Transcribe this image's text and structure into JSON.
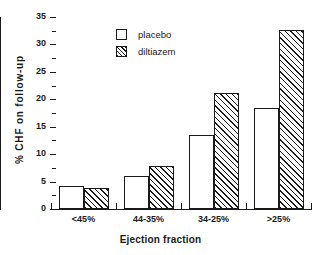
{
  "chart_data": {
    "type": "bar",
    "title": "",
    "xlabel": "Ejection fraction",
    "ylabel": "% CHF  on  follow-up",
    "categories": [
      "<45%",
      "44-35%",
      "34-25%",
      ">25%"
    ],
    "series": [
      {
        "name": "placebo",
        "values": [
          4.2,
          6.0,
          13.4,
          18.5
        ]
      },
      {
        "name": "diltiazem",
        "values": [
          3.9,
          7.9,
          21.2,
          32.7
        ]
      }
    ],
    "ylim": [
      0,
      35
    ],
    "yticks": [
      0,
      5,
      10,
      15,
      20,
      25,
      30,
      35
    ],
    "ytick_labels": [
      "0",
      "5",
      "10",
      "15",
      "20",
      "25",
      "30",
      "35"
    ],
    "grid": false,
    "legend_position": "upper-left-inside",
    "colors": {
      "axis": "#1a1a1a",
      "text": "#1a1a1a",
      "placebo_fill": "#ffffff",
      "diltiazem_fill": "#ffffff",
      "hatch": "#1a1a1a",
      "background": "#ffffff"
    }
  },
  "legend": {
    "items": [
      {
        "label": "placebo",
        "style": "open-square-swatch"
      },
      {
        "label": "diltiazem",
        "style": "hatched-square-swatch"
      }
    ]
  }
}
